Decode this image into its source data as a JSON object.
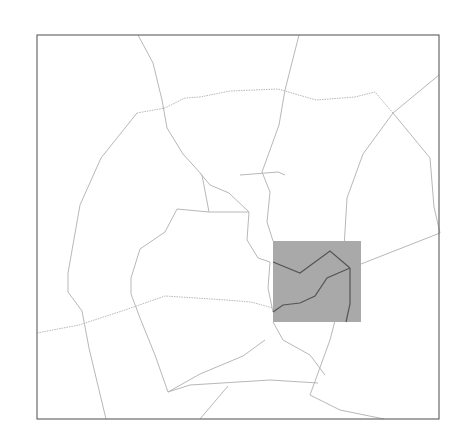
{
  "map": {
    "frame": {
      "x": 37,
      "y": 35,
      "width": 402,
      "height": 384,
      "stroke": "#6a6a6a"
    },
    "highlight": {
      "x": 273,
      "y": 241,
      "width": 88,
      "height": 81,
      "fill": "#a9a9a9"
    },
    "road_color": "#b8b8b8",
    "highlight_road_color": "#555555",
    "roads": [
      "M138,35 L153,63 L162,100 L167,128 L183,154 L202,175 L209,212",
      "M299,35 L285,90 L279,125 L262,172 L270,192 L267,222 L273,241",
      "M137,113 L101,158 L80,205 L68,273",
      "M137,113 L165,108 L185,98 L200,97 L230,91 L278,89 L316,100 L355,97 L375,92 L393,113",
      "M393,113 L430,158 L434,207 L440,233",
      "M439,75 L393,113 L363,154 L347,198 L343,264",
      "M343,264 L339,305 L330,340 L310,395 L340,410 L384,419",
      "M37,333 L79,325 L125,310 L165,296 L226,300 L251,302 L273,308",
      "M68,273 L68,292 L82,311 L89,348 L93,365 L106,419",
      "M200,173 L210,185 L229,193 L249,212 L247,240 L258,258 L270,262 L268,288 L273,312",
      "M177,209 L165,232 L140,249 L131,278 L131,294 L140,318",
      "M140,318 L155,355 L168,392",
      "M168,392 L200,374 L243,356 L265,340",
      "M168,392 L190,385 L270,380 L318,383",
      "M200,419 L228,386",
      "M273,322 L283,340 L310,355 L325,375",
      "M209,212 L249,212",
      "M209,212 L177,209",
      "M361,264 L440,233",
      "M240,175 L278,172 L285,175"
    ],
    "highlight_roads": [
      "M273,262 L300,273 L330,251 L350,268",
      "M350,268 L327,278 L315,296 L300,303 L283,305 L273,312",
      "M350,268 L350,304 L346,322"
    ]
  }
}
